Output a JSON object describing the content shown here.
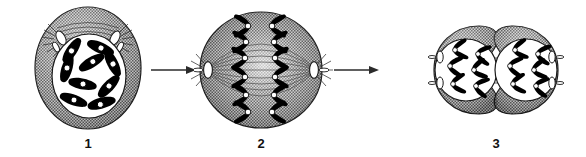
{
  "figure": {
    "caption": "",
    "background_color": "#ffffff",
    "width": 586,
    "height": 157
  },
  "palette": {
    "cytoplasm_fill": "#8f8f8f",
    "cytoplasm_stipple": "#4a4a4a",
    "nucleus_fill": "#ffffff",
    "chromosome_fill": "#000000",
    "centromere_fill": "#ffffff",
    "outline": "#1a1a1a",
    "arrow_color": "#2b2b2b",
    "spindle_fiber": "#5d5d5d",
    "centriole_fill": "#ffffff"
  },
  "stages": [
    {
      "id": "stage-1",
      "label": "1",
      "name": "prophase-cell",
      "shape": "round-cell",
      "nucleus_visible": true,
      "chromosome_count": 9,
      "chromosome_form": "condensed-rods",
      "centriole_pairs": 2,
      "centriole_position": "top",
      "aster_rays": true,
      "spindle_visible": false,
      "cleavage_furrow": false
    },
    {
      "id": "stage-2",
      "label": "2",
      "name": "anaphase-cell",
      "shape": "oval-cell",
      "nucleus_visible": false,
      "chromosome_count": 12,
      "chromosome_form": "v-shaped-separating",
      "chromosome_rows": 6,
      "centriole_pairs": 2,
      "centriole_position": "poles-left-right",
      "aster_rays": true,
      "spindle_visible": true,
      "cleavage_furrow": false
    },
    {
      "id": "stage-3",
      "label": "3",
      "name": "telophase-cytokinesis-cell",
      "shape": "dumbbell-two-lobes",
      "nucleus_visible": true,
      "daughter_nuclei": 2,
      "chromosome_count_per_nucleus": 6,
      "chromosome_form": "v-shaped-clustered",
      "centriole_pairs": 2,
      "centriole_position": "outer-poles",
      "aster_rays": false,
      "spindle_visible": true,
      "midbody_fibers": true,
      "cleavage_furrow": true
    }
  ],
  "arrows": [
    {
      "id": "arrow-1",
      "name": "arrow-stage1-to-stage2",
      "direction": "right",
      "from": "1",
      "to": "2"
    },
    {
      "id": "arrow-2",
      "name": "arrow-stage2-to-stage3",
      "direction": "right",
      "from": "2",
      "to": "3"
    }
  ]
}
